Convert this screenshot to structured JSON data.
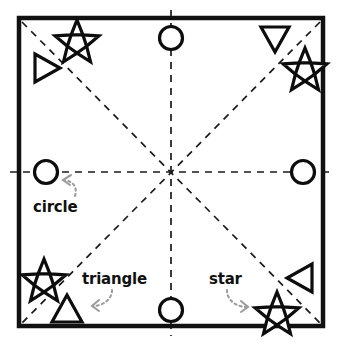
{
  "figure": {
    "type": "shape-arrangement-diagram",
    "background_color": "#ffffff",
    "frame": {
      "name": "square-border",
      "color": "#111111",
      "stroke_width": 4,
      "x": 17,
      "y": 16,
      "width": 308,
      "height": 312
    },
    "center_point": {
      "x": 171,
      "y": 172
    }
  },
  "guides": {
    "style": "dashed",
    "color": "#1a1a1a",
    "stroke_width": 1.6,
    "dash": "7 6",
    "lines": [
      {
        "name": "horizontal-axis",
        "x1": 10,
        "y1": 172,
        "x2": 332,
        "y2": 172
      },
      {
        "name": "vertical-axis",
        "x1": 171,
        "y1": 10,
        "x2": 171,
        "y2": 336
      },
      {
        "name": "diagonal-nwse",
        "x1": 22,
        "y1": 22,
        "x2": 320,
        "y2": 323
      },
      {
        "name": "diagonal-nesw",
        "x1": 320,
        "y1": 22,
        "x2": 22,
        "y2": 323
      }
    ]
  },
  "shapes": [
    {
      "name": "star-top-left",
      "kind": "star",
      "cx": 77,
      "cy": 38,
      "r": 20,
      "rotation": 0
    },
    {
      "name": "triangle-right-pointing",
      "kind": "triangle-right",
      "cx": 45,
      "cy": 68,
      "r": 17
    },
    {
      "name": "circle-top-center",
      "kind": "circle",
      "cx": 171,
      "cy": 38,
      "r": 12
    },
    {
      "name": "triangle-down-pointing",
      "kind": "triangle-down",
      "cx": 275,
      "cy": 39,
      "r": 17
    },
    {
      "name": "star-top-right",
      "kind": "star",
      "cx": 305,
      "cy": 66,
      "r": 20,
      "rotation": 0
    },
    {
      "name": "circle-left-middle",
      "kind": "circle",
      "cx": 46,
      "cy": 172,
      "r": 12
    },
    {
      "name": "circle-right-middle",
      "cx": 303,
      "cy": 172,
      "r": 12,
      "kind": "circle"
    },
    {
      "name": "star-bottom-left",
      "kind": "star",
      "cx": 44,
      "cy": 277,
      "r": 20,
      "rotation": 0
    },
    {
      "name": "triangle-up-pointing",
      "kind": "triangle-up",
      "cx": 67,
      "cy": 310,
      "r": 17
    },
    {
      "name": "circle-bottom-center",
      "kind": "circle",
      "cx": 171,
      "cy": 310,
      "r": 12
    },
    {
      "name": "triangle-left-pointing",
      "kind": "triangle-left",
      "cx": 302,
      "cy": 278,
      "r": 17
    },
    {
      "name": "star-bottom-right",
      "kind": "star",
      "cx": 277,
      "cy": 310,
      "r": 20,
      "rotation": 0
    }
  ],
  "labels": {
    "circle": "circle",
    "triangle": "triangle",
    "star": "star"
  },
  "callouts": {
    "color": "#9a9a9a",
    "style": "dotted",
    "items": [
      {
        "name": "callout-arrow-circle",
        "target": "circle-left-middle",
        "direction": "up-left"
      },
      {
        "name": "callout-arrow-triangle",
        "target": "triangle-up-pointing",
        "direction": "left"
      },
      {
        "name": "callout-arrow-star",
        "target": "star-bottom-right",
        "direction": "right"
      }
    ]
  },
  "colors": {
    "ink": "#111111",
    "guide": "#1a1a1a",
    "callout": "#9a9a9a",
    "background": "#ffffff"
  }
}
